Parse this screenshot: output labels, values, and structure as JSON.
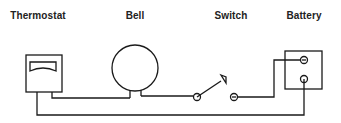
{
  "diagram": {
    "components": [
      {
        "id": "thermostat",
        "label": "Thermostat",
        "label_x": 38
      },
      {
        "id": "bell",
        "label": "Bell",
        "label_x": 135
      },
      {
        "id": "switch",
        "label": "Switch",
        "label_x": 231
      },
      {
        "id": "battery",
        "label": "Battery",
        "label_x": 304
      }
    ],
    "colors": {
      "stroke": "#1a1a1a",
      "background": "#ffffff",
      "text": "#222222"
    }
  }
}
